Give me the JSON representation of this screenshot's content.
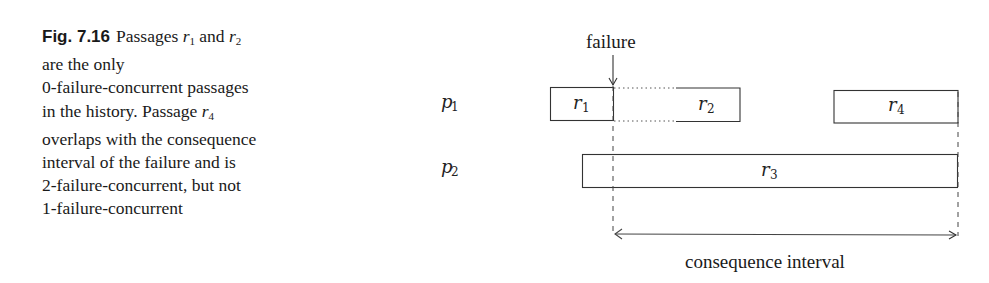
{
  "caption": {
    "label": "Fig. 7.16",
    "lines": [
      [
        "Passages ",
        "r",
        "1",
        " and ",
        "r",
        "2"
      ],
      "are the only",
      "0-failure-concurrent passages",
      [
        "in the history. Passage ",
        "r",
        "4"
      ],
      "overlaps with the consequence",
      "interval of the failure and is",
      "2-failure-concurrent, but not",
      "1-failure-concurrent"
    ]
  },
  "diagram": {
    "failure_label": "failure",
    "interval_label": "consequence interval",
    "processes": [
      {
        "name": "p",
        "sub": "1"
      },
      {
        "name": "p",
        "sub": "2"
      }
    ],
    "passages": [
      {
        "name": "r",
        "sub": "1",
        "process": "p1"
      },
      {
        "name": "r",
        "sub": "2",
        "process": "p1"
      },
      {
        "name": "r",
        "sub": "3",
        "process": "p2"
      },
      {
        "name": "r",
        "sub": "4",
        "process": "p1"
      }
    ],
    "colors": {
      "stroke": "#333333",
      "text": "#1a1a1a"
    }
  }
}
